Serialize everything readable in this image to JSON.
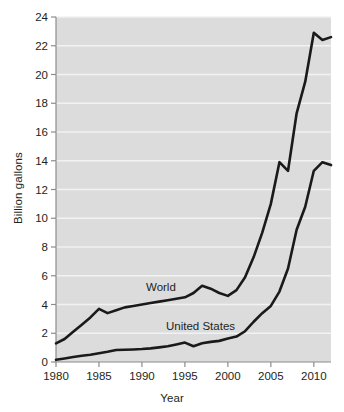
{
  "chart_data": {
    "type": "line",
    "title": "",
    "xlabel": "Year",
    "ylabel": "Billion gallons",
    "xlim": [
      1980,
      2012
    ],
    "ylim": [
      0,
      24
    ],
    "yticks": [
      0,
      2,
      4,
      6,
      8,
      10,
      12,
      14,
      16,
      18,
      20,
      22,
      24
    ],
    "xticks": [
      1980,
      1985,
      1990,
      1995,
      2000,
      2005,
      2010
    ],
    "grid": "horizontal",
    "legend_position": "inline-annotation",
    "plot_background": "#dcdcdc",
    "gridline_color": "#f2f2f2",
    "line_color": "#1a1a1a",
    "page_background": "#ffffff",
    "x": [
      1980,
      1981,
      1982,
      1983,
      1984,
      1985,
      1986,
      1987,
      1988,
      1989,
      1990,
      1991,
      1992,
      1993,
      1994,
      1995,
      1996,
      1997,
      1998,
      1999,
      2000,
      2001,
      2002,
      2003,
      2004,
      2005,
      2006,
      2007,
      2008,
      2009,
      2010,
      2011,
      2012
    ],
    "series": [
      {
        "name": "World",
        "label": "World",
        "values": [
          1.3,
          1.6,
          2.1,
          2.6,
          3.1,
          3.7,
          3.4,
          3.6,
          3.8,
          3.9,
          4.0,
          4.1,
          4.2,
          4.3,
          4.4,
          4.5,
          4.8,
          5.3,
          5.1,
          4.8,
          4.6,
          5.0,
          5.9,
          7.3,
          9.0,
          11.0,
          13.9,
          13.3,
          17.3,
          19.5,
          22.9,
          22.4,
          22.6
        ]
      },
      {
        "name": "United States",
        "label": "United States",
        "values": [
          0.15,
          0.25,
          0.35,
          0.43,
          0.5,
          0.61,
          0.71,
          0.83,
          0.85,
          0.87,
          0.9,
          0.95,
          1.02,
          1.1,
          1.22,
          1.35,
          1.1,
          1.3,
          1.4,
          1.47,
          1.63,
          1.77,
          2.14,
          2.8,
          3.4,
          3.9,
          4.9,
          6.5,
          9.2,
          10.8,
          13.3,
          13.9,
          13.7
        ]
      }
    ]
  },
  "axes": {
    "ylabel": "Billion gallons",
    "xlabel": "Year",
    "ytick_labels": [
      "0",
      "2",
      "4",
      "6",
      "8",
      "10",
      "12",
      "14",
      "16",
      "18",
      "20",
      "22",
      "24"
    ],
    "xtick_labels": [
      "1980",
      "1985",
      "1990",
      "1995",
      "2000",
      "2005",
      "2010"
    ]
  },
  "annotations": {
    "world": "World",
    "united_states": "United States"
  }
}
